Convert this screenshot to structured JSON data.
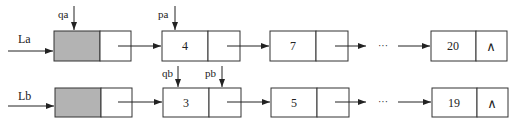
{
  "colors": {
    "stroke": "#333333",
    "head_fill": "#b3b3b3",
    "node_fill": "#ffffff"
  },
  "list_a": {
    "label": "La",
    "pointers": [
      {
        "name": "qa",
        "target": "head"
      },
      {
        "name": "pa",
        "target": "node0"
      }
    ],
    "nodes": [
      "4",
      "7"
    ],
    "ellipsis": "···",
    "last_node": "20",
    "null_symbol": "∧"
  },
  "list_b": {
    "label": "Lb",
    "pointers": [
      {
        "name": "qb",
        "target": "node0-data"
      },
      {
        "name": "pb",
        "target": "node0-next"
      }
    ],
    "nodes": [
      "3",
      "5"
    ],
    "ellipsis": "···",
    "last_node": "19",
    "null_symbol": "∧"
  }
}
